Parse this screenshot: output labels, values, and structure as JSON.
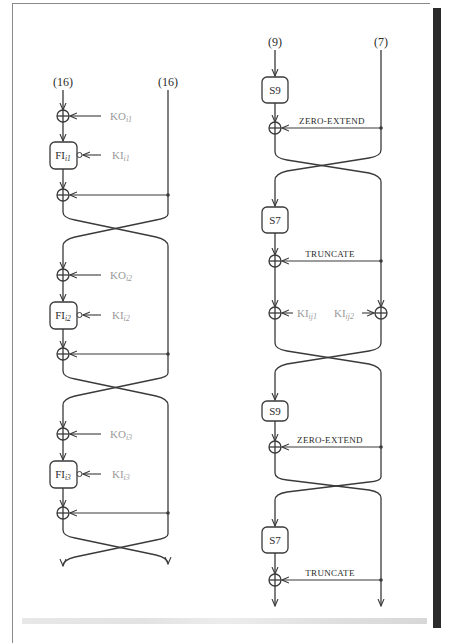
{
  "figure": {
    "left_diagram": {
      "title": "FO function",
      "inputs": {
        "left": "(16)",
        "right": "(16)"
      },
      "rounds": [
        {
          "ko_label": "KO",
          "ko_sub": "i1",
          "fi_label": "FI",
          "fi_sub": "i1",
          "ki_label": "KI",
          "ki_sub": "i1"
        },
        {
          "ko_label": "KO",
          "ko_sub": "i2",
          "fi_label": "FI",
          "fi_sub": "i2",
          "ki_label": "KI",
          "ki_sub": "i2"
        },
        {
          "ko_label": "KO",
          "ko_sub": "i3",
          "fi_label": "FI",
          "fi_sub": "i3",
          "ki_label": "KI",
          "ki_sub": "i3"
        }
      ]
    },
    "right_diagram": {
      "title": "FI function",
      "inputs": {
        "left": "(9)",
        "right": "(7)"
      },
      "stages": [
        {
          "sbox": "S9",
          "op": "ZERO-EXTEND"
        },
        {
          "sbox": "S7",
          "op": "TRUNCATE"
        },
        {
          "sbox": "S9",
          "op": "ZERO-EXTEND"
        },
        {
          "sbox": "S7",
          "op": "TRUNCATE"
        }
      ],
      "subkeys": {
        "left": {
          "label": "KI",
          "sub": "ij1"
        },
        "right": {
          "label": "KI",
          "sub": "ij2"
        }
      }
    },
    "colors": {
      "line": "#3a3a3a",
      "key_text": "#9a9a9a",
      "text": "#2b2b2b"
    }
  }
}
